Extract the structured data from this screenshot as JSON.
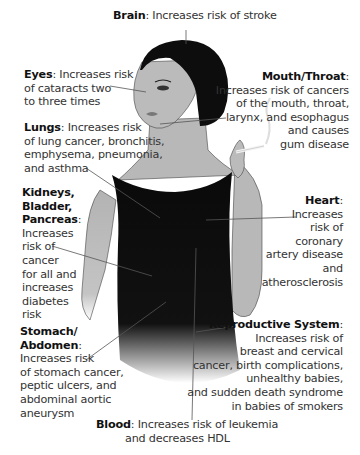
{
  "diagram": {
    "callouts": [
      {
        "id": "brain",
        "title": "Brain",
        "text": "Increases risk of stroke"
      },
      {
        "id": "eyes",
        "title": "Eyes",
        "lines": [
          "Increases risk",
          "of cataracts two",
          "to three times"
        ]
      },
      {
        "id": "mouth",
        "title": "Mouth/Throat",
        "lines": [
          "Increases risk of cancers",
          "of the mouth, throat,",
          "larynx, and esophagus",
          "and causes",
          "gum disease"
        ]
      },
      {
        "id": "lungs",
        "title": "Lungs",
        "lines": [
          "Increases risk",
          "of lung cancer, bronchitis,",
          "emphysema, pneumonia,",
          "and asthma"
        ]
      },
      {
        "id": "kidneys",
        "title_lines": [
          "Kidneys,",
          "Bladder,",
          "Pancreas"
        ],
        "lines": [
          "Increases",
          "risk of",
          "cancer",
          "for all and",
          "increases",
          "diabetes",
          "risk"
        ]
      },
      {
        "id": "heart",
        "title": "Heart",
        "lines": [
          "Increases",
          "risk of",
          "coronary",
          "artery disease",
          "and",
          "atherosclerosis"
        ]
      },
      {
        "id": "stomach",
        "title_lines": [
          "Stomach/",
          "Abdomen"
        ],
        "lines": [
          "Increases risk",
          "of stomach cancer,",
          "peptic ulcers, and",
          "abdominal aortic",
          "aneurysm"
        ]
      },
      {
        "id": "reproductive",
        "title": "Reproductive System",
        "lines": [
          "Increases risk of",
          "breast and cervical",
          "cancer, birth complications,",
          "unhealthy babies,",
          "and sudden death syndrome",
          "in babies of smokers"
        ]
      },
      {
        "id": "blood",
        "title": "Blood",
        "lines": [
          "Increases risk of leukemia",
          "and decreases HDL"
        ]
      }
    ],
    "colors": {
      "skin": "#b5b5b5",
      "hair": "#0d0d0d",
      "top": "#0a0a0a",
      "leader": "#555555",
      "text": "#333333"
    }
  }
}
